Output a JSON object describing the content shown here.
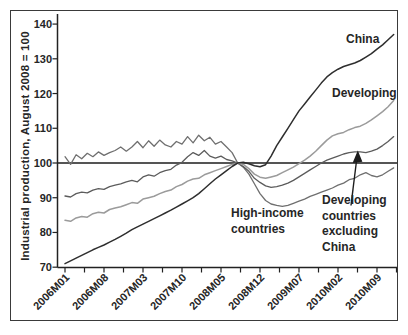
{
  "chart_data": {
    "type": "line",
    "title": "",
    "ylabel": "Industrial production, August 2008 = 100",
    "x_frequency": "monthly",
    "x_range": [
      "2006M01",
      "2010M12"
    ],
    "x_tick_labels": [
      "2006M01",
      "2006M08",
      "2007M03",
      "2007M10",
      "2008M05",
      "2008M12",
      "2009M07",
      "2010M02",
      "2010M09"
    ],
    "y_ticks": [
      140,
      130,
      120,
      110,
      100,
      90,
      80,
      70
    ],
    "y_tick_labels": [
      "140",
      "130",
      "120",
      "110",
      "100",
      "90",
      "80",
      "70"
    ],
    "ylim": [
      70,
      140
    ],
    "grid": "off",
    "legend": "inline-annotations",
    "reference_line_y": 100,
    "annotations": {
      "china": "China",
      "developing": "Developing",
      "high_income": [
        "High-income",
        "countries"
      ],
      "developing_ex_china": [
        "Developing",
        "countries",
        "excluding",
        "China"
      ]
    },
    "series": [
      {
        "name": "China",
        "color": "#2e2e2e",
        "width": 1.5,
        "values": [
          71,
          71.8,
          72.6,
          73.4,
          74.2,
          75,
          75.7,
          76.4,
          77.2,
          78,
          78.9,
          79.8,
          80.8,
          81.6,
          82.4,
          83.2,
          84,
          84.8,
          85.6,
          86.4,
          87.3,
          88.2,
          89.1,
          90,
          91.2,
          92.6,
          94,
          95.4,
          96.6,
          97.8,
          99,
          100,
          100.2,
          99.8,
          99.2,
          98.9,
          99.5,
          102,
          105,
          107.5,
          110,
          112.5,
          115,
          117,
          119,
          121,
          123,
          124.8,
          126,
          127,
          127.8,
          128.3,
          128.8,
          129.5,
          130.5,
          131.5,
          132.8,
          134,
          135.5,
          137
        ]
      },
      {
        "name": "Developing",
        "color": "#9b9b9b",
        "width": 1.5,
        "values": [
          83.5,
          83.2,
          84.2,
          84.6,
          84.4,
          85.4,
          85.8,
          85.6,
          86.6,
          87,
          87.4,
          88,
          88.6,
          88.4,
          89.6,
          90,
          90.4,
          91.2,
          91.8,
          92.2,
          93.2,
          93.8,
          94.8,
          95.4,
          95.6,
          96.6,
          97.2,
          97.8,
          98.4,
          99,
          99.6,
          100,
          99.6,
          98.4,
          96.8,
          95.9,
          95.6,
          96,
          96.4,
          97.2,
          98,
          98.8,
          99.8,
          100.8,
          102,
          103.4,
          105,
          106.6,
          107.8,
          108.4,
          108.8,
          109.6,
          110.2,
          110.6,
          111.4,
          112.4,
          113.6,
          114.8,
          116.2,
          118
        ]
      },
      {
        "name": "Developing countries excluding China",
        "color": "#5c5c5c",
        "width": 1.3,
        "values": [
          90.5,
          90.2,
          91.2,
          91.6,
          91.4,
          92.2,
          92.6,
          92.4,
          93.2,
          93.6,
          94,
          94.6,
          95,
          94.6,
          96,
          96.6,
          96.2,
          97.2,
          97.8,
          98.2,
          99.4,
          100.2,
          101.8,
          103,
          102.2,
          103.6,
          102,
          101.4,
          102,
          101,
          100.6,
          100,
          99,
          97.6,
          95.6,
          94.4,
          93.4,
          93,
          93.2,
          93.6,
          94.2,
          95,
          96,
          97,
          98,
          99,
          100,
          100.8,
          101.4,
          102,
          102.6,
          103,
          103.2,
          103.2,
          103,
          103.4,
          104,
          105,
          106.2,
          107.6
        ]
      },
      {
        "name": "High-income countries",
        "color": "#6f6f6f",
        "width": 1.3,
        "values": [
          101.8,
          99.6,
          102.4,
          101.2,
          102.8,
          101.8,
          103.2,
          102.2,
          103,
          103.6,
          104.6,
          103.4,
          104.6,
          106.2,
          104.4,
          106.4,
          104.8,
          106.6,
          105.2,
          104.6,
          106.2,
          105.4,
          107.6,
          105.8,
          108,
          106.4,
          107.4,
          105.4,
          106.2,
          104.6,
          103,
          100,
          98.8,
          96.8,
          94,
          91.2,
          89.2,
          88.2,
          87.8,
          87.5,
          87.8,
          88.4,
          89,
          89.6,
          90.4,
          91,
          91.6,
          92.2,
          92.8,
          93.6,
          94.2,
          95.2,
          95.6,
          96.6,
          97.2,
          96.4,
          96,
          96.6,
          97.6,
          98.6
        ]
      }
    ]
  }
}
